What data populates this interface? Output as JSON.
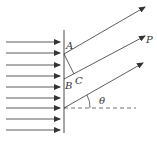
{
  "diagram": {
    "type": "single-slit diffraction",
    "labels": {
      "A": "A",
      "B": "B",
      "C": "C",
      "P": "P",
      "theta": "θ"
    },
    "incident_rays": {
      "count": 9,
      "direction": "right"
    },
    "diffracted_rays": {
      "count": 3,
      "direction": "up-right"
    },
    "colors": {
      "line": "#333333",
      "background": "#ffffff"
    }
  }
}
